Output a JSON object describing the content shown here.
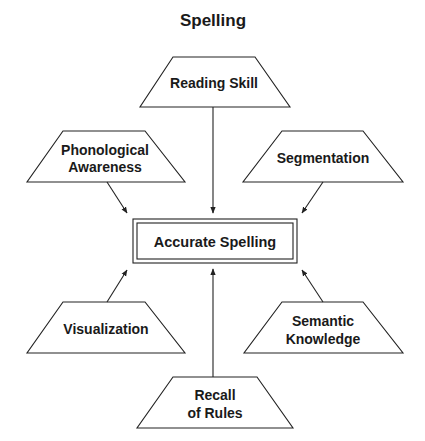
{
  "title": "Spelling",
  "center": {
    "label": "Accurate Spelling"
  },
  "factors": {
    "reading_skill": {
      "lines": [
        "Reading Skill"
      ]
    },
    "phonological_awareness": {
      "lines": [
        "Phonological",
        "Awareness"
      ]
    },
    "segmentation": {
      "lines": [
        "Segmentation"
      ]
    },
    "visualization": {
      "lines": [
        "Visualization"
      ]
    },
    "semantic_knowledge": {
      "lines": [
        "Semantic",
        "Knowledge"
      ]
    },
    "recall_of_rules": {
      "lines": [
        "Recall",
        "of Rules"
      ]
    }
  },
  "colors": {
    "stroke": "#222222",
    "text": "#1a1a1a",
    "background": "#ffffff"
  }
}
